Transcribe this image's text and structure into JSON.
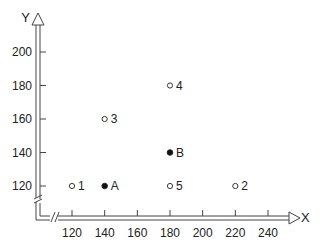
{
  "chart_data": {
    "type": "scatter",
    "title": "",
    "xlabel": "X",
    "ylabel": "Y",
    "xlim": [
      110,
      255
    ],
    "ylim": [
      110,
      215
    ],
    "x_ticks": [
      120,
      140,
      160,
      180,
      200,
      220,
      240
    ],
    "y_ticks": [
      120,
      140,
      160,
      180,
      200
    ],
    "x_tick_labels": [
      "120",
      "140",
      "160",
      "180",
      "200",
      "220",
      "240"
    ],
    "y_tick_labels": [
      "120",
      "140",
      "160",
      "180",
      "200"
    ],
    "axis_breaks": true,
    "grid": false,
    "series": [
      {
        "name": "open",
        "marker": "open-circle",
        "points": [
          {
            "label": "1",
            "x": 120,
            "y": 120
          },
          {
            "label": "2",
            "x": 220,
            "y": 120
          },
          {
            "label": "3",
            "x": 140,
            "y": 160
          },
          {
            "label": "4",
            "x": 180,
            "y": 180
          },
          {
            "label": "5",
            "x": 180,
            "y": 120
          }
        ]
      },
      {
        "name": "filled",
        "marker": "filled-circle",
        "points": [
          {
            "label": "A",
            "x": 140,
            "y": 120
          },
          {
            "label": "B",
            "x": 180,
            "y": 140
          }
        ]
      }
    ]
  }
}
